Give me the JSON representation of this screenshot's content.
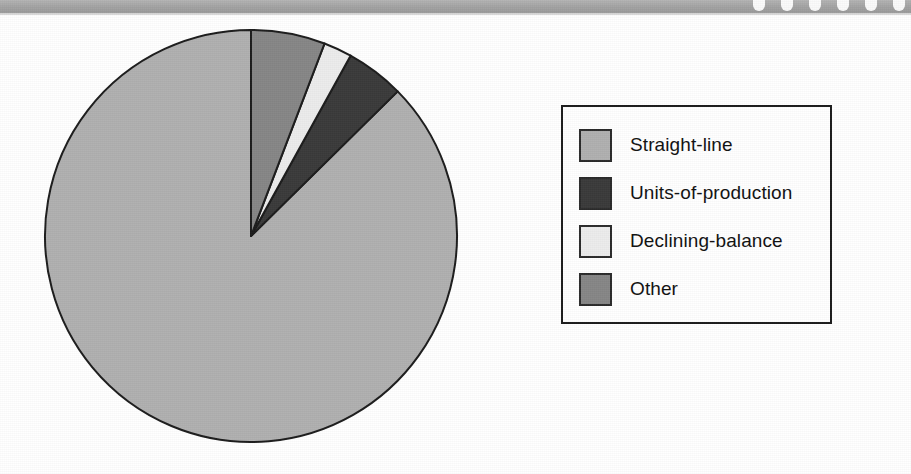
{
  "header": {
    "notch_count": 6,
    "strip_color": "#a9a9a9"
  },
  "legend": {
    "items": [
      {
        "label": "Straight-line",
        "color": "#b0b0b0"
      },
      {
        "label": "Units-of-production",
        "color": "#3a3a3a"
      },
      {
        "label": "Declining-balance",
        "color": "#ececec"
      },
      {
        "label": "Other",
        "color": "#868686"
      }
    ]
  },
  "chart_data": {
    "type": "pie",
    "title": "",
    "subtitle": "",
    "xlabel": "",
    "ylabel": "",
    "grid": false,
    "legend_position": "right",
    "start_angle_deg": 90,
    "direction": "counterclockwise",
    "categories": [
      "Straight-line",
      "Units-of-production",
      "Declining-balance",
      "Other"
    ],
    "values": [
      87.4,
      4.6,
      2.2,
      5.8
    ],
    "units": "percent",
    "slice_angles_deg": [
      314.6,
      16.5,
      8.0,
      20.9
    ],
    "colors": [
      "#b0b0b0",
      "#3a3a3a",
      "#ececec",
      "#868686"
    ],
    "slice_border_color": "#1c1c1c",
    "series": [
      {
        "name": "Depreciation method usage",
        "values": [
          87.4,
          4.6,
          2.2,
          5.8
        ]
      }
    ]
  }
}
